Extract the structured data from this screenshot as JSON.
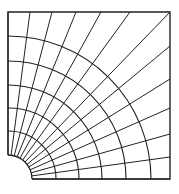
{
  "diagram": {
    "title": "",
    "stroke_color": "#222222",
    "background": "#ffffff",
    "box": {
      "x0": 8,
      "y0": 12,
      "x1": 170,
      "y1": 179
    },
    "hole": {
      "cx": 8,
      "cy": 179,
      "r": 24
    },
    "arc_radii": [
      48,
      71,
      94,
      118,
      143
    ],
    "radial_count": 13,
    "top_edge_x": [
      30,
      52,
      76,
      101,
      130
    ],
    "right_edge_y": [
      46,
      79,
      108,
      134,
      157
    ]
  }
}
